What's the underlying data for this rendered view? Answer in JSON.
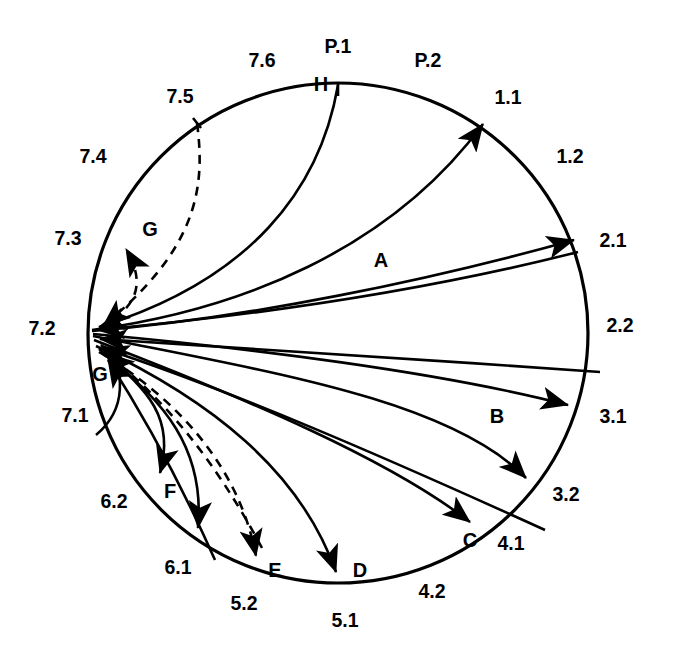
{
  "diagram": {
    "type": "circular-flow-diagram",
    "shape": "circle",
    "center": {
      "x": 338,
      "y": 333
    },
    "radius": 250,
    "convergence_node": "7.2",
    "stroke_color": "#000000",
    "background_color": "#ffffff"
  },
  "sector_labels": [
    {
      "id": "P1",
      "text": "P.1",
      "x": 338,
      "y": 48,
      "angle_deg": 90
    },
    {
      "id": "P2",
      "text": "P.2",
      "x": 428,
      "y": 62,
      "angle_deg": 72
    },
    {
      "id": "L11",
      "text": "1.1",
      "x": 508,
      "y": 99,
      "angle_deg": 52
    },
    {
      "id": "L12",
      "text": "1.2",
      "x": 570,
      "y": 158,
      "angle_deg": 35
    },
    {
      "id": "L21",
      "text": "2.1",
      "x": 613,
      "y": 242,
      "angle_deg": 17
    },
    {
      "id": "L22",
      "text": "2.2",
      "x": 620,
      "y": 327,
      "angle_deg": 0
    },
    {
      "id": "L31",
      "text": "3.1",
      "x": 613,
      "y": 418,
      "angle_deg": -18
    },
    {
      "id": "L32",
      "text": "3.2",
      "x": 566,
      "y": 496,
      "angle_deg": -37
    },
    {
      "id": "L41",
      "text": "4.1",
      "x": 511,
      "y": 545,
      "angle_deg": -52
    },
    {
      "id": "L42",
      "text": "4.2",
      "x": 432,
      "y": 593,
      "angle_deg": -68
    },
    {
      "id": "L51",
      "text": "5.1",
      "x": 345,
      "y": 622,
      "angle_deg": -90
    },
    {
      "id": "L52",
      "text": "5.2",
      "x": 244,
      "y": 605,
      "angle_deg": -108
    },
    {
      "id": "L61",
      "text": "6.1",
      "x": 178,
      "y": 569,
      "angle_deg": -124
    },
    {
      "id": "L62",
      "text": "6.2",
      "x": 114,
      "y": 503,
      "angle_deg": -143
    },
    {
      "id": "L71",
      "text": "7.1",
      "x": 75,
      "y": 417,
      "angle_deg": -163
    },
    {
      "id": "L72",
      "text": "7.2",
      "x": 42,
      "y": 330,
      "angle_deg": 180
    },
    {
      "id": "L73",
      "text": "7.3",
      "x": 68,
      "y": 240,
      "angle_deg": 160
    },
    {
      "id": "L74",
      "text": "7.4",
      "x": 93,
      "y": 158,
      "angle_deg": 142
    },
    {
      "id": "L75",
      "text": "7.5",
      "x": 180,
      "y": 98,
      "angle_deg": 122
    },
    {
      "id": "L76",
      "text": "7.6",
      "x": 262,
      "y": 62,
      "angle_deg": 105
    }
  ],
  "flow_labels": [
    {
      "id": "A",
      "text": "A",
      "x": 381,
      "y": 262
    },
    {
      "id": "B",
      "text": "B",
      "x": 497,
      "y": 418
    },
    {
      "id": "C",
      "text": "C",
      "x": 470,
      "y": 542
    },
    {
      "id": "D",
      "text": "D",
      "x": 360,
      "y": 572
    },
    {
      "id": "E",
      "text": "E",
      "x": 275,
      "y": 572
    },
    {
      "id": "F",
      "text": "F",
      "x": 170,
      "y": 493
    },
    {
      "id": "G_lower",
      "text": "G",
      "x": 100,
      "y": 376
    },
    {
      "id": "G_upper",
      "text": "G",
      "x": 150,
      "y": 231
    },
    {
      "id": "H",
      "text": "H",
      "x": 321,
      "y": 86
    }
  ],
  "flows": [
    {
      "id": "A",
      "from": "7.2",
      "to": "1.1",
      "style": "solid",
      "direction": "outbound",
      "label": "A"
    },
    {
      "id": "A2",
      "from": "7.2",
      "to": "2.1",
      "style": "solid",
      "direction": "outbound",
      "label": "A"
    },
    {
      "id": "B",
      "from": "7.2",
      "to": "3.1",
      "style": "solid",
      "direction": "outbound",
      "label": "B"
    },
    {
      "id": "B2",
      "from": "7.2",
      "to": "3.2",
      "style": "solid",
      "direction": "outbound",
      "label": "B"
    },
    {
      "id": "C",
      "from": "7.2",
      "to": "4.1",
      "style": "solid",
      "direction": "outbound",
      "label": "C"
    },
    {
      "id": "D",
      "from": "7.2",
      "to": "5.1",
      "style": "solid",
      "direction": "outbound",
      "label": "D"
    },
    {
      "id": "E",
      "from": "7.2",
      "to": "5.2",
      "style": "dashed",
      "direction": "outbound",
      "label": "E"
    },
    {
      "id": "F1",
      "from": "7.2",
      "to": "6.2",
      "style": "solid",
      "direction": "outbound",
      "label": "F"
    },
    {
      "id": "F2",
      "from": "7.2",
      "to": "6.1",
      "style": "solid",
      "direction": "outbound",
      "label": "F"
    },
    {
      "id": "G1",
      "from": "7.1",
      "to": "7.2",
      "style": "solid",
      "direction": "inbound",
      "label": "G"
    },
    {
      "id": "G2",
      "from": "7.5",
      "to": "7.2",
      "style": "dashed",
      "direction": "inbound",
      "label": "G"
    },
    {
      "id": "G3",
      "from": "7.5",
      "to": "7.3",
      "style": "dashed",
      "direction": "inbound",
      "label": "G"
    },
    {
      "id": "H",
      "from": "P.1",
      "to": "7.2",
      "style": "solid",
      "direction": "inbound",
      "label": "H"
    },
    {
      "id": "IN1",
      "from": "2.1",
      "to": "7.2",
      "style": "solid",
      "direction": "inbound",
      "label": ""
    },
    {
      "id": "IN2",
      "from": "3.1",
      "to": "7.2",
      "style": "solid",
      "direction": "inbound",
      "label": ""
    },
    {
      "id": "IN3",
      "from": "4.1",
      "to": "7.2",
      "style": "solid",
      "direction": "inbound",
      "label": ""
    },
    {
      "id": "IN4",
      "from": "6.1",
      "to": "7.2",
      "style": "solid",
      "direction": "inbound",
      "label": ""
    },
    {
      "id": "IN5",
      "from": "5.2",
      "to": "7.2",
      "style": "dashed",
      "direction": "inbound",
      "label": "E"
    }
  ]
}
